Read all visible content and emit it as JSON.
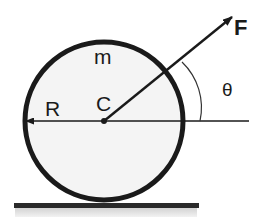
{
  "diagram": {
    "labels": {
      "force": "F",
      "mass": "m",
      "center": "C",
      "radius": "R",
      "angle": "θ"
    },
    "colors": {
      "stroke": "#1a1a1a",
      "disk_fill": "#f4f4f4",
      "ground": "#2a2a2a",
      "ground_shade": "#dcdcdc",
      "background": "#ffffff"
    }
  }
}
